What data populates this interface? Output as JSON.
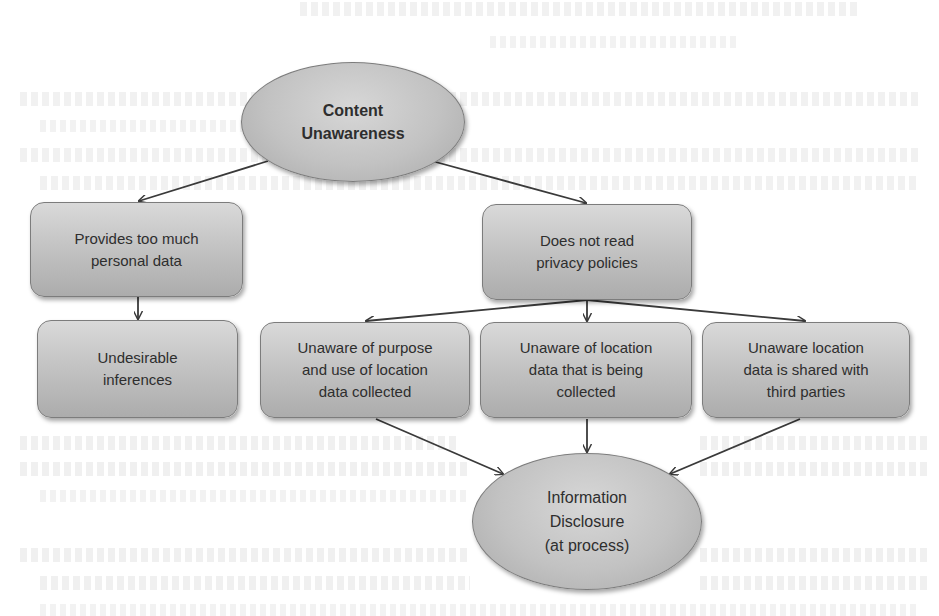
{
  "diagram": {
    "nodes": {
      "content_unawareness": {
        "shape": "ellipse",
        "label": "Content\nUnawareness"
      },
      "provides_too_much": {
        "shape": "rounded-box",
        "label": "Provides too much\npersonal data"
      },
      "undesirable_inferences": {
        "shape": "rounded-box",
        "label": "Undesirable\ninferences"
      },
      "does_not_read": {
        "shape": "rounded-box",
        "label": "Does not read\nprivacy policies"
      },
      "unaware_purpose": {
        "shape": "rounded-box",
        "label": "Unaware of purpose\nand use of location\ndata collected"
      },
      "unaware_collected": {
        "shape": "rounded-box",
        "label": "Unaware of location\ndata that is being\ncollected"
      },
      "unaware_shared": {
        "shape": "rounded-box",
        "label": "Unaware location\ndata is shared with\nthird parties"
      },
      "information_disclosure": {
        "shape": "ellipse",
        "label": "Information\nDisclosure\n(at process)"
      }
    },
    "edges": [
      {
        "from": "content_unawareness",
        "to": "provides_too_much"
      },
      {
        "from": "content_unawareness",
        "to": "does_not_read"
      },
      {
        "from": "provides_too_much",
        "to": "undesirable_inferences"
      },
      {
        "from": "does_not_read",
        "to": "unaware_purpose"
      },
      {
        "from": "does_not_read",
        "to": "unaware_collected"
      },
      {
        "from": "does_not_read",
        "to": "unaware_shared"
      },
      {
        "from": "unaware_purpose",
        "to": "information_disclosure"
      },
      {
        "from": "unaware_collected",
        "to": "information_disclosure"
      },
      {
        "from": "unaware_shared",
        "to": "information_disclosure"
      }
    ],
    "colors": {
      "node_fill_light": "#d9d9d9",
      "node_fill_dark": "#acacac",
      "node_border": "#7c7c7c",
      "edge": "#3a3a3a",
      "text": "#2e2e2e",
      "background": "#ffffff"
    }
  }
}
